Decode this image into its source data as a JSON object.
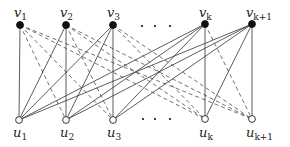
{
  "diagram": {
    "title": "",
    "top_vertices": [
      {
        "id": "v1",
        "base": "v",
        "sub": "1",
        "x": 20,
        "y": 25,
        "filled": true
      },
      {
        "id": "v2",
        "base": "v",
        "sub": "2",
        "x": 66,
        "y": 25,
        "filled": true
      },
      {
        "id": "v3",
        "base": "v",
        "sub": "3",
        "x": 113,
        "y": 25,
        "filled": true
      },
      {
        "id": "vk",
        "base": "v",
        "sub": "k",
        "x": 205,
        "y": 24,
        "filled": true
      },
      {
        "id": "vk1",
        "base": "v",
        "sub": "k+1",
        "x": 252,
        "y": 24,
        "filled": true
      }
    ],
    "bottom_vertices": [
      {
        "id": "u1",
        "base": "u",
        "sub": "1",
        "x": 19,
        "y": 120,
        "filled": false
      },
      {
        "id": "u2",
        "base": "u",
        "sub": "2",
        "x": 66,
        "y": 120,
        "filled": false
      },
      {
        "id": "u3",
        "base": "u",
        "sub": "3",
        "x": 113,
        "y": 120,
        "filled": false
      },
      {
        "id": "uk",
        "base": "u",
        "sub": "k",
        "x": 205,
        "y": 119,
        "filled": false
      },
      {
        "id": "uk1",
        "base": "u",
        "sub": "k+1",
        "x": 252,
        "y": 119,
        "filled": false
      }
    ],
    "ellipsis_top": [
      {
        "x": 142,
        "y": 26
      },
      {
        "x": 155,
        "y": 26
      },
      {
        "x": 170,
        "y": 26
      }
    ],
    "ellipsis_bottom": [
      {
        "x": 143,
        "y": 119
      },
      {
        "x": 155,
        "y": 119
      },
      {
        "x": 170,
        "y": 119
      }
    ],
    "edge_rule": "v_i to u_j solid if j <= i, dashed if j > i",
    "colors": {
      "edge": "#333333",
      "node_fill": "#111111",
      "open_node_fill": "#ffffff"
    }
  }
}
